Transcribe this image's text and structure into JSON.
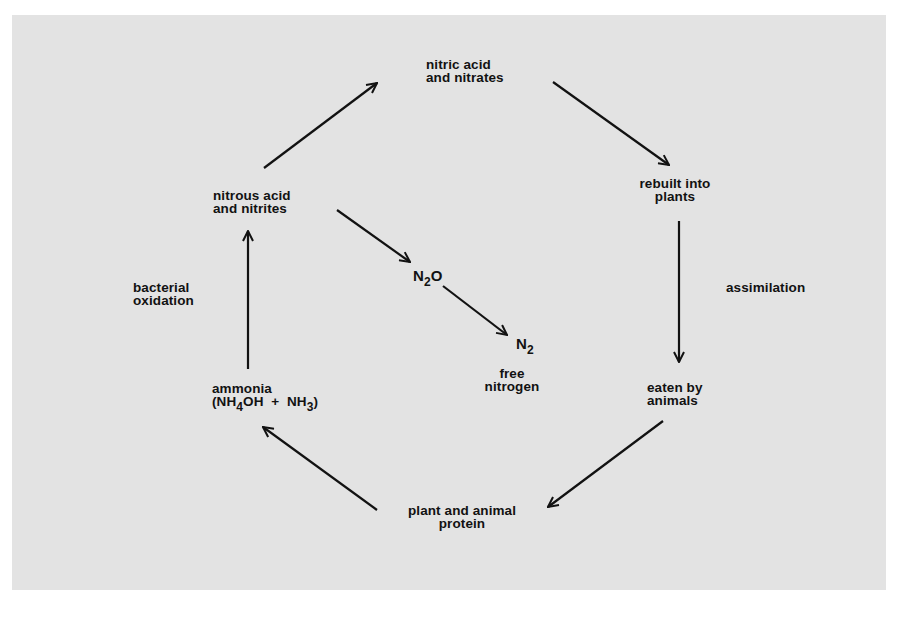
{
  "diagram": {
    "colors": {
      "background": "#ffffff",
      "panel": "#e3e3e3",
      "ink": "#121212"
    },
    "nodes": {
      "nitric": {
        "line1": "nitric acid",
        "line2": "and nitrates"
      },
      "rebuilt": {
        "line1": "rebuilt into",
        "line2": "plants"
      },
      "eaten": {
        "line1": "eaten by",
        "line2": "animals"
      },
      "protein": {
        "line1": "plant and animal",
        "line2": "protein"
      },
      "ammonia": {
        "line1": "ammonia",
        "formula_open": "(NH",
        "sub1": "4",
        "formula_mid": "OH  +  NH",
        "sub2": "3",
        "formula_close": ")"
      },
      "nitrous": {
        "line1": "nitrous acid",
        "line2": "and nitrites"
      },
      "n2o": {
        "base": "N",
        "sub": "2",
        "suffix": "O"
      },
      "n2": {
        "base": "N",
        "sub": "2"
      },
      "free_nitrogen": {
        "line1": "free",
        "line2": "nitrogen"
      }
    },
    "process_labels": {
      "assimilation": "assimilation",
      "bacterial_oxidation": {
        "line1": "bacterial",
        "line2": "oxidation"
      }
    },
    "edges": [
      {
        "from": "nitrous acid and nitrites",
        "to": "nitric acid and nitrates"
      },
      {
        "from": "nitric acid and nitrates",
        "to": "rebuilt into plants"
      },
      {
        "from": "rebuilt into plants",
        "to": "eaten by animals"
      },
      {
        "from": "eaten by animals",
        "to": "plant and animal protein"
      },
      {
        "from": "plant and animal protein",
        "to": "ammonia"
      },
      {
        "from": "ammonia",
        "to": "nitrous acid and nitrites"
      },
      {
        "from": "nitrous acid and nitrites",
        "to": "N2O"
      },
      {
        "from": "N2O",
        "to": "N2"
      }
    ]
  }
}
